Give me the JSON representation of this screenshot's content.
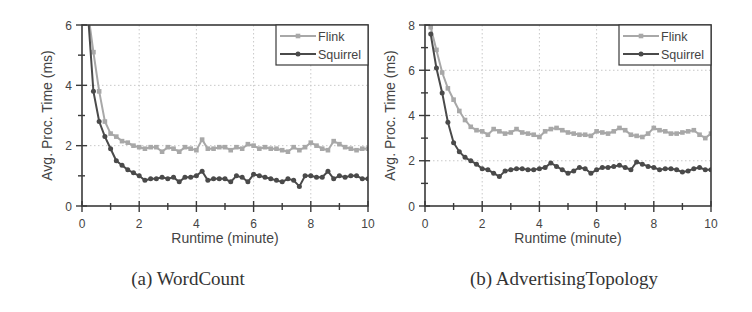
{
  "chart_data": [
    {
      "type": "line",
      "caption": "(a) WordCount",
      "xlabel": "Runtime (minute)",
      "ylabel": "Avg. Proc. Time (ms)",
      "xlim": [
        0,
        10
      ],
      "ylim": [
        0,
        6
      ],
      "xticks": [
        0,
        2,
        4,
        6,
        8,
        10
      ],
      "yticks": [
        0,
        2,
        4,
        6
      ],
      "grid": true,
      "legend_position": "upper right",
      "x": [
        0.2,
        0.4,
        0.6,
        0.8,
        1.0,
        1.2,
        1.4,
        1.6,
        1.8,
        2.0,
        2.2,
        2.4,
        2.6,
        2.8,
        3.0,
        3.2,
        3.4,
        3.6,
        3.8,
        4.0,
        4.2,
        4.4,
        4.6,
        4.8,
        5.0,
        5.2,
        5.4,
        5.6,
        5.8,
        6.0,
        6.2,
        6.4,
        6.6,
        6.8,
        7.0,
        7.2,
        7.4,
        7.6,
        7.8,
        8.0,
        8.2,
        8.4,
        8.6,
        8.8,
        9.0,
        9.2,
        9.4,
        9.6,
        9.8,
        10.0
      ],
      "series": [
        {
          "name": "Flink",
          "color": "#a8a8a8",
          "marker": "square",
          "values": [
            6.5,
            5.1,
            3.8,
            2.8,
            2.4,
            2.3,
            2.15,
            2.1,
            2.0,
            1.95,
            1.9,
            1.95,
            1.95,
            1.8,
            1.95,
            1.9,
            1.8,
            1.95,
            1.9,
            1.85,
            2.2,
            1.9,
            1.9,
            1.95,
            1.95,
            1.85,
            1.95,
            1.9,
            2.05,
            2.0,
            1.9,
            1.95,
            1.9,
            1.9,
            1.85,
            1.8,
            1.95,
            1.85,
            1.95,
            2.1,
            2.0,
            1.9,
            1.85,
            2.15,
            2.05,
            1.95,
            1.9,
            1.85,
            1.9,
            1.9
          ]
        },
        {
          "name": "Squirrel",
          "color": "#4a4a4a",
          "marker": "circle",
          "values": [
            6.5,
            3.8,
            2.8,
            2.3,
            1.9,
            1.5,
            1.35,
            1.2,
            1.1,
            1.0,
            0.85,
            0.9,
            0.9,
            0.95,
            0.9,
            0.95,
            0.8,
            0.95,
            0.95,
            1.0,
            1.15,
            0.85,
            0.9,
            0.9,
            0.9,
            0.8,
            1.0,
            0.95,
            0.8,
            1.05,
            1.0,
            0.95,
            0.9,
            0.85,
            0.8,
            0.9,
            0.85,
            0.65,
            1.0,
            1.0,
            0.95,
            0.95,
            1.15,
            0.9,
            1.0,
            0.95,
            1.0,
            1.0,
            0.9,
            0.9
          ]
        }
      ]
    },
    {
      "type": "line",
      "caption": "(b) AdvertisingTopology",
      "xlabel": "Runtime (minute)",
      "ylabel": "Avg. Proc. Time (ms)",
      "xlim": [
        0,
        10
      ],
      "ylim": [
        0,
        8
      ],
      "xticks": [
        0,
        2,
        4,
        6,
        8,
        10
      ],
      "yticks": [
        0,
        2,
        4,
        6,
        8
      ],
      "grid": true,
      "legend_position": "upper right",
      "x": [
        0.2,
        0.4,
        0.6,
        0.8,
        1.0,
        1.2,
        1.4,
        1.6,
        1.8,
        2.0,
        2.2,
        2.4,
        2.6,
        2.8,
        3.0,
        3.2,
        3.4,
        3.6,
        3.8,
        4.0,
        4.2,
        4.4,
        4.6,
        4.8,
        5.0,
        5.2,
        5.4,
        5.6,
        5.8,
        6.0,
        6.2,
        6.4,
        6.6,
        6.8,
        7.0,
        7.2,
        7.4,
        7.6,
        7.8,
        8.0,
        8.2,
        8.4,
        8.6,
        8.8,
        9.0,
        9.2,
        9.4,
        9.6,
        9.8,
        10.0
      ],
      "series": [
        {
          "name": "Flink",
          "color": "#a8a8a8",
          "marker": "square",
          "values": [
            7.9,
            6.9,
            5.9,
            5.2,
            4.7,
            4.2,
            3.8,
            3.5,
            3.35,
            3.3,
            3.15,
            3.4,
            3.3,
            3.2,
            3.25,
            3.4,
            3.25,
            3.2,
            3.15,
            3.05,
            3.3,
            3.4,
            3.45,
            3.35,
            3.25,
            3.2,
            3.15,
            3.15,
            3.1,
            3.3,
            3.25,
            3.2,
            3.3,
            3.45,
            3.35,
            3.15,
            3.1,
            3.05,
            3.2,
            3.45,
            3.35,
            3.3,
            3.2,
            3.2,
            3.25,
            3.3,
            3.35,
            3.15,
            3.0,
            3.2
          ]
        },
        {
          "name": "Squirrel",
          "color": "#4a4a4a",
          "marker": "circle",
          "values": [
            7.6,
            6.1,
            5.0,
            3.7,
            2.8,
            2.4,
            2.15,
            2.0,
            1.85,
            1.65,
            1.6,
            1.45,
            1.3,
            1.55,
            1.6,
            1.65,
            1.65,
            1.6,
            1.6,
            1.65,
            1.7,
            1.9,
            1.75,
            1.6,
            1.45,
            1.55,
            1.7,
            1.65,
            1.45,
            1.6,
            1.7,
            1.7,
            1.75,
            1.8,
            1.7,
            1.6,
            1.95,
            1.85,
            1.75,
            1.7,
            1.6,
            1.65,
            1.65,
            1.6,
            1.5,
            1.55,
            1.65,
            1.7,
            1.6,
            1.6
          ]
        }
      ]
    }
  ]
}
